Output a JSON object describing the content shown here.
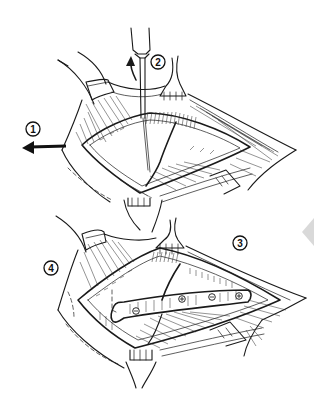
{
  "figure": {
    "type": "surgical-illustration",
    "panels": [
      {
        "id": "upper",
        "description": "Exposed bone fracture with retractors; drill/instrument inserted",
        "step_labels": [
          {
            "number": "1",
            "note": "arrow pointing left (traction)"
          },
          {
            "number": "2",
            "note": "instrument with upward curved arrow"
          }
        ]
      },
      {
        "id": "lower",
        "description": "Fracture fixed with plate and four screws; retractors in place",
        "plate_screws": 4,
        "step_labels": [
          {
            "number": "3"
          },
          {
            "number": "4"
          }
        ]
      }
    ],
    "labels": {
      "one": "1",
      "two": "2",
      "three": "3",
      "four": "4"
    },
    "colors": {
      "ink": "#1a1a1a",
      "background": "#ffffff",
      "nav_arrow": "#d9d9d9"
    }
  },
  "overlay": {
    "nav_arrow_icon": "triangle-left"
  }
}
